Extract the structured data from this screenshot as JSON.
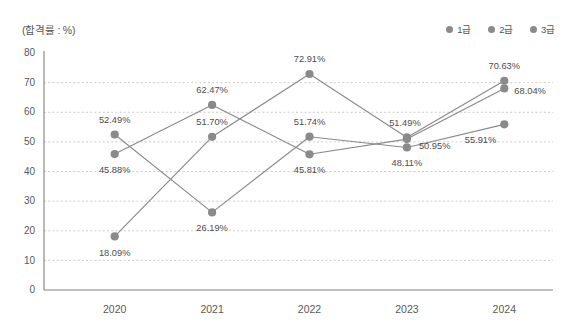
{
  "unit_label": "(합격률 : %)",
  "legend": {
    "items": [
      {
        "label": "1급",
        "color": "#8a8a8a"
      },
      {
        "label": "2급",
        "color": "#8a8a8a"
      },
      {
        "label": "3급",
        "color": "#8a8a8a"
      }
    ]
  },
  "chart_data": {
    "type": "line",
    "title": "",
    "subtitle": "",
    "xlabel": "",
    "ylabel": "(합격률 : %)",
    "categories": [
      "2020",
      "2021",
      "2022",
      "2023",
      "2024"
    ],
    "ylim": [
      0,
      80
    ],
    "ytick_step": 10,
    "yticks": [
      "80",
      "70",
      "60",
      "50",
      "40",
      "30",
      "20",
      "10",
      "0"
    ],
    "grid": true,
    "legend_position": "top-right",
    "value_suffix": "%",
    "series": [
      {
        "name": "1급",
        "color": "#8a8a8a",
        "values": [
          52.49,
          26.19,
          51.74,
          48.11,
          55.91
        ],
        "labels": [
          "52.49%",
          "26.19%",
          "51.74%",
          "48.11%",
          "55.91%"
        ]
      },
      {
        "name": "2급",
        "color": "#8a8a8a",
        "values": [
          45.88,
          62.47,
          45.81,
          50.95,
          68.04
        ],
        "labels": [
          "45.88%",
          "62.47%",
          "45.81%",
          "50.95%",
          "68.04%"
        ]
      },
      {
        "name": "3급",
        "color": "#8a8a8a",
        "values": [
          18.09,
          51.7,
          72.91,
          51.49,
          70.63
        ],
        "labels": [
          "18.09%",
          "51.70%",
          "72.91%",
          "51.49%",
          "70.63%"
        ]
      }
    ]
  },
  "colors": {
    "grid": "#bfbfbf",
    "axis": "#808080",
    "marker": "#8a8a8a",
    "line": "#8a8a8a",
    "text": "#4d4d4d",
    "background": "#ffffff"
  }
}
